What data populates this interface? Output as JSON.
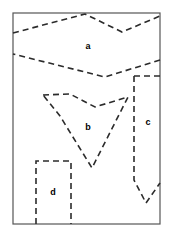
{
  "figure": {
    "width": 173,
    "height": 236,
    "background_color": "#ffffff",
    "stroke_color": "#2b2b2b",
    "border_color": "#555555",
    "border": {
      "x": 13,
      "y": 13,
      "width": 147,
      "height": 211,
      "stroke_width": 1.2,
      "style": "solid"
    },
    "dash_pattern": "6,4",
    "dash_stroke_width": 1.6,
    "labels": [
      {
        "name": "region-label-a",
        "text": "a",
        "x": 88,
        "y": 47
      },
      {
        "name": "region-label-b",
        "text": "b",
        "x": 88,
        "y": 128
      },
      {
        "name": "region-label-c",
        "text": "c",
        "x": 148,
        "y": 123
      },
      {
        "name": "region-label-d",
        "text": "d",
        "x": 53,
        "y": 193
      }
    ],
    "regions": [
      {
        "id": "a",
        "label": "a",
        "description": "upper band spanning full width with notched top and pointed bottom",
        "path": "M 13 33 L 85 14 L 122 32 L 160 16 M 160 60 L 105 77 L 13 54"
      },
      {
        "id": "b",
        "label": "b",
        "description": "central chevron shape with flat top and V-shaped bottom",
        "path": "M 43 95 L 70 94 L 95 107 L 128 97 L 92 168 L 60 116 L 43 95"
      },
      {
        "id": "c",
        "label": "c",
        "description": "right column bounded by vertical dashed edge with V-shaped bottom",
        "path": "M 134 76 L 160 76 M 134 76 L 134 180 L 146 203 L 160 183"
      },
      {
        "id": "d",
        "label": "d",
        "description": "lower-left rectangle open at the bottom border",
        "path": "M 36 224 L 36 161 L 71 161 L 71 224"
      }
    ]
  }
}
